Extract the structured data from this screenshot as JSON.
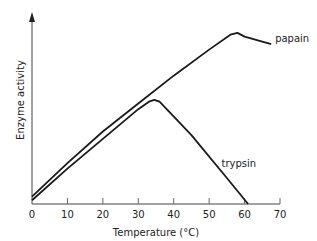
{
  "chart_data": {
    "type": "line",
    "title": "",
    "xlabel": "Temperature (°C)",
    "ylabel": "Enzyme activity",
    "xlim": [
      0,
      70
    ],
    "ylim": [
      0,
      100
    ],
    "xticks": [
      0,
      10,
      20,
      30,
      40,
      50,
      60,
      70
    ],
    "grid": false,
    "series": [
      {
        "name": "papain",
        "label": "papain",
        "points": [
          [
            0,
            4
          ],
          [
            10,
            22
          ],
          [
            20,
            39
          ],
          [
            30,
            54
          ],
          [
            40,
            69
          ],
          [
            50,
            83
          ],
          [
            56,
            91
          ],
          [
            58,
            92
          ],
          [
            60,
            90
          ],
          [
            67.5,
            86
          ]
        ]
      },
      {
        "name": "trypsin",
        "label": "trypsin",
        "points": [
          [
            0,
            2
          ],
          [
            10,
            19
          ],
          [
            20,
            35
          ],
          [
            30,
            51
          ],
          [
            33,
            55
          ],
          [
            34.5,
            56
          ],
          [
            36,
            55
          ],
          [
            45,
            37
          ],
          [
            55,
            14
          ],
          [
            61,
            0
          ]
        ]
      }
    ]
  }
}
